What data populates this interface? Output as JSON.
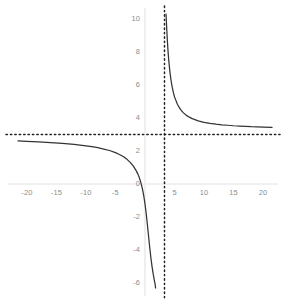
{
  "chart_data": {
    "type": "line",
    "title": "",
    "subtitle": "",
    "xlabel": "",
    "ylabel": "",
    "xlim": [
      -21.5,
      21.5
    ],
    "ylim": [
      -6.3,
      10.3
    ],
    "grid": false,
    "legend": null,
    "legend_position": "none",
    "x_ticks": [
      -20,
      -15,
      -10,
      -5,
      5,
      10,
      15,
      20
    ],
    "x_tick_labels": [
      "-20",
      "-15",
      "-10",
      "-5",
      "5",
      "10",
      "15",
      "20"
    ],
    "y_ticks": [
      10,
      8,
      6,
      4,
      2,
      0,
      -2,
      -4,
      -6
    ],
    "y_tick_labels": [
      "10",
      "8",
      "6",
      "4",
      "2",
      "0",
      "-2",
      "-4",
      "-6"
    ],
    "annotations": [
      {
        "name": "vertical-asymptote",
        "kind": "vline",
        "x": 3.3,
        "style": "dotted",
        "color": "#222222"
      },
      {
        "name": "horizontal-asymptote",
        "kind": "hline",
        "y": 3.0,
        "style": "dotted",
        "color": "#222222"
      }
    ],
    "series": [
      {
        "name": "left-branch",
        "color": "#333333",
        "style": "solid",
        "points": [
          [
            -21.5,
            2.61
          ],
          [
            -20.0,
            2.59
          ],
          [
            -18.0,
            2.55
          ],
          [
            -16.0,
            2.51
          ],
          [
            -14.0,
            2.46
          ],
          [
            -12.0,
            2.4
          ],
          [
            -10.0,
            2.31
          ],
          [
            -9.0,
            2.26
          ],
          [
            -8.0,
            2.2
          ],
          [
            -7.0,
            2.12
          ],
          [
            -6.0,
            2.03
          ],
          [
            -5.0,
            1.9
          ],
          [
            -4.5,
            1.82
          ],
          [
            -4.0,
            1.73
          ],
          [
            -3.5,
            1.62
          ],
          [
            -3.0,
            1.48
          ],
          [
            -2.5,
            1.31
          ],
          [
            -2.0,
            1.1
          ],
          [
            -1.5,
            0.81
          ],
          [
            -1.2,
            0.6
          ],
          [
            -1.0,
            0.42
          ],
          [
            -0.8,
            0.21
          ],
          [
            -0.6,
            -0.05
          ],
          [
            -0.4,
            -0.36
          ],
          [
            -0.2,
            -0.74
          ],
          [
            0.0,
            -1.21
          ],
          [
            0.2,
            -1.78
          ],
          [
            0.4,
            -2.44
          ],
          [
            0.6,
            -3.15
          ],
          [
            0.8,
            -3.85
          ],
          [
            1.0,
            -4.48
          ],
          [
            1.2,
            -5.02
          ],
          [
            1.4,
            -5.48
          ],
          [
            1.55,
            -5.78
          ],
          [
            1.7,
            -6.05
          ],
          [
            1.8,
            -6.3
          ]
        ]
      },
      {
        "name": "right-branch",
        "color": "#333333",
        "style": "solid",
        "points": [
          [
            3.55,
            10.3
          ],
          [
            3.6,
            10.0
          ],
          [
            3.7,
            9.25
          ],
          [
            3.8,
            8.6
          ],
          [
            3.9,
            8.05
          ],
          [
            4.0,
            7.58
          ],
          [
            4.2,
            6.85
          ],
          [
            4.4,
            6.3
          ],
          [
            4.6,
            5.88
          ],
          [
            4.8,
            5.55
          ],
          [
            5.0,
            5.28
          ],
          [
            5.5,
            4.82
          ],
          [
            6.0,
            4.52
          ],
          [
            6.5,
            4.31
          ],
          [
            7.0,
            4.16
          ],
          [
            7.5,
            4.05
          ],
          [
            8.0,
            3.96
          ],
          [
            9.0,
            3.83
          ],
          [
            10.0,
            3.74
          ],
          [
            11.0,
            3.68
          ],
          [
            12.0,
            3.63
          ],
          [
            13.0,
            3.59
          ],
          [
            14.0,
            3.56
          ],
          [
            15.0,
            3.53
          ],
          [
            16.0,
            3.51
          ],
          [
            17.0,
            3.49
          ],
          [
            18.0,
            3.47
          ],
          [
            19.0,
            3.46
          ],
          [
            20.0,
            3.45
          ],
          [
            21.5,
            3.43
          ]
        ]
      }
    ],
    "axis_lines": {
      "x_axis_color": "#e2e2e2",
      "y_axis_color": "#ececec",
      "x_axis_y": 0,
      "y_axis_x": 0
    }
  },
  "colors": {
    "curve": "#333333",
    "asymptote": "#222222",
    "tick_text": "#8d8d8d",
    "axis": "#e4e4e4",
    "background": "#ffffff"
  }
}
